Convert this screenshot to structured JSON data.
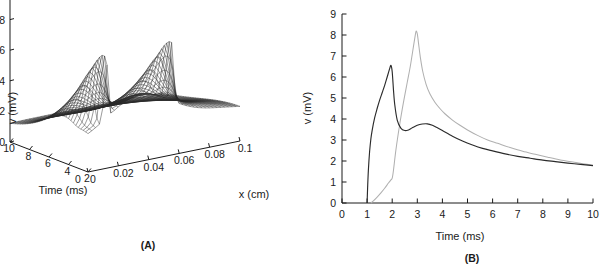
{
  "figure": {
    "panel_a_label": "(A)",
    "panel_b_label": "(B)"
  },
  "chart_data": [
    {
      "type": "area",
      "id": "panel-a",
      "title": "",
      "subtitle": "3D mesh surface of transmembrane potential v(x,t)",
      "xlabel": "x (cm)",
      "ylabel": "Time (ms)",
      "zlabel": "v (mV)",
      "grid": false,
      "legend": "none",
      "projection": "3d-mesh",
      "xlim": [
        0,
        0.1
      ],
      "ylim": [
        2,
        10
      ],
      "zlim": [
        0,
        10
      ],
      "xticks": [
        "0",
        "0.02",
        "0.04",
        "0.06",
        "0.08",
        "0.1"
      ],
      "xtick_values": [
        0,
        0.02,
        0.04,
        0.06,
        0.08,
        0.1
      ],
      "yticks": [
        "10",
        "8",
        "6",
        "4",
        "2"
      ],
      "ytick_values": [
        10,
        8,
        6,
        4,
        2
      ],
      "ytick_order": "descending-left-to-right",
      "zticks": [
        "0",
        "2",
        "4",
        "6",
        "8",
        "10"
      ],
      "ztick_values": [
        0,
        2,
        4,
        6,
        8,
        10
      ],
      "origin_extra_tick": "0",
      "surface_notes": {
        "resting_level_mv": 1.8,
        "peak_count": 2,
        "peak_height_mv": 6.0,
        "peak_x_positions_cm": [
          0.012,
          0.055
        ],
        "peak_time_ms": 2.0,
        "mesh_lines_x": 41,
        "mesh_lines_t": 33
      }
    },
    {
      "type": "line",
      "id": "panel-b",
      "title": "",
      "xlabel": "Time (ms)",
      "ylabel": "v (mV)",
      "grid": false,
      "legend": "none",
      "xlim": [
        0,
        10
      ],
      "ylim": [
        0,
        9
      ],
      "xticks": [
        "0",
        "1",
        "2",
        "3",
        "4",
        "5",
        "6",
        "7",
        "8",
        "9",
        "10"
      ],
      "xtick_values": [
        0,
        1,
        2,
        3,
        4,
        5,
        6,
        7,
        8,
        9,
        10
      ],
      "yticks": [
        "0",
        "1",
        "2",
        "3",
        "4",
        "5",
        "6",
        "7",
        "8",
        "9"
      ],
      "ytick_values": [
        0,
        1,
        2,
        3,
        4,
        5,
        6,
        7,
        8,
        9
      ],
      "series": [
        {
          "name": "trace-dark",
          "color": "#2b2b2b",
          "peak_time_ms": 1.95,
          "peak_value_mv": 6.55,
          "onset_time_ms": 1.0,
          "x": [
            1.0,
            1.02,
            1.05,
            1.1,
            1.15,
            1.2,
            1.3,
            1.4,
            1.5,
            1.6,
            1.7,
            1.8,
            1.9,
            1.95,
            2.0,
            2.05,
            2.1,
            2.2,
            2.35,
            2.5,
            2.65,
            2.8,
            3.0,
            3.2,
            3.4,
            3.6,
            3.8,
            4.0,
            4.4,
            4.8,
            5.2,
            5.6,
            6.0,
            6.5,
            7.0,
            7.5,
            8.0,
            8.5,
            9.0,
            9.5,
            10.0
          ],
          "y": [
            0.0,
            0.7,
            1.55,
            2.45,
            3.05,
            3.45,
            4.05,
            4.5,
            4.9,
            5.25,
            5.6,
            6.0,
            6.4,
            6.55,
            6.25,
            5.4,
            4.7,
            3.95,
            3.55,
            3.45,
            3.48,
            3.58,
            3.7,
            3.76,
            3.77,
            3.7,
            3.58,
            3.45,
            3.18,
            2.95,
            2.76,
            2.6,
            2.48,
            2.34,
            2.22,
            2.13,
            2.04,
            1.97,
            1.9,
            1.84,
            1.78
          ]
        },
        {
          "name": "trace-light",
          "color": "#b0b0b0",
          "peak_time_ms": 2.95,
          "peak_value_mv": 8.18,
          "onset_time_ms": 1.15,
          "x": [
            1.15,
            1.25,
            1.4,
            1.55,
            1.7,
            1.85,
            1.95,
            2.0,
            2.05,
            2.15,
            2.3,
            2.45,
            2.6,
            2.72,
            2.82,
            2.9,
            2.95,
            3.0,
            3.05,
            3.12,
            3.22,
            3.35,
            3.5,
            3.7,
            3.9,
            4.1,
            4.4,
            4.7,
            5.0,
            5.4,
            5.8,
            6.2,
            6.7,
            7.2,
            7.7,
            8.2,
            8.7,
            9.2,
            9.6,
            10.0
          ],
          "y": [
            0.0,
            0.1,
            0.28,
            0.48,
            0.7,
            0.95,
            1.1,
            1.18,
            1.55,
            2.55,
            3.75,
            4.8,
            5.75,
            6.5,
            7.25,
            7.85,
            8.18,
            8.05,
            7.6,
            6.95,
            6.25,
            5.65,
            5.2,
            4.8,
            4.5,
            4.25,
            3.95,
            3.7,
            3.48,
            3.22,
            3.0,
            2.84,
            2.64,
            2.46,
            2.32,
            2.18,
            2.05,
            1.95,
            1.87,
            1.8
          ]
        }
      ]
    }
  ]
}
